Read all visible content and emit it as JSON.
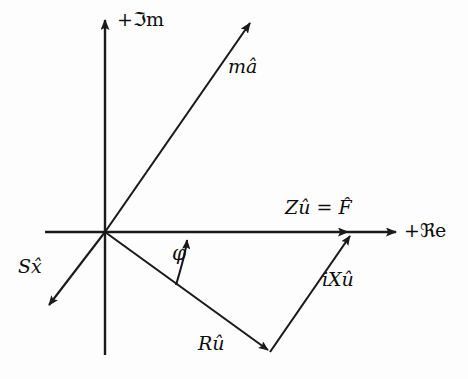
{
  "figure": {
    "background_color": "#fdfdfd",
    "ink_color": "#1a1a1a",
    "origin": {
      "x": 105,
      "y": 232
    }
  },
  "axes": {
    "imaginary": {
      "label": "+ℑm",
      "label_plain": "+Im",
      "name": "imaginary-axis",
      "from": {
        "x": 105,
        "y": 355
      },
      "to": {
        "x": 105,
        "y": 18
      },
      "arrow": "up"
    },
    "real": {
      "label": "+ℜe",
      "label_plain": "+Re",
      "name": "real-axis",
      "from": {
        "x": 45,
        "y": 232
      },
      "to": {
        "x": 398,
        "y": 232
      },
      "arrow": "right"
    }
  },
  "vectors": [
    {
      "id": "ma",
      "label": "mâ",
      "description": "mass times acceleration phasor",
      "from": {
        "x": 105,
        "y": 232
      },
      "to": {
        "x": 252,
        "y": 21
      },
      "arrow": true
    },
    {
      "id": "sx",
      "label": "Sx̂",
      "label_plain": "Sx̂",
      "description": "stiffness times displacement phasor",
      "from": {
        "x": 105,
        "y": 232
      },
      "to": {
        "x": 47,
        "y": 307
      },
      "arrow": true
    },
    {
      "id": "ru",
      "label": "Rû",
      "description": "resistance times velocity phasor",
      "from": {
        "x": 105,
        "y": 232
      },
      "to": {
        "x": 270,
        "y": 352
      },
      "arrow": true
    },
    {
      "id": "ixu",
      "label": "iXû",
      "description": "reactance times velocity phasor",
      "from": {
        "x": 270,
        "y": 352
      },
      "to": {
        "x": 352,
        "y": 234
      },
      "arrow": true
    },
    {
      "id": "zu",
      "label": "Zû = F̂",
      "label_plain": "Zû = F̂",
      "description": "impedance times velocity equals force phasor along real axis",
      "from": {
        "x": 105,
        "y": 232
      },
      "to": {
        "x": 350,
        "y": 232
      },
      "arrow": true
    }
  ],
  "angle": {
    "symbol": "φ",
    "name": "phase-angle-phi",
    "between": [
      "Rû",
      "+ℜe"
    ],
    "arc_from": {
      "x": 178,
      "y": 283
    },
    "arc_to": {
      "x": 188,
      "y": 236
    }
  }
}
